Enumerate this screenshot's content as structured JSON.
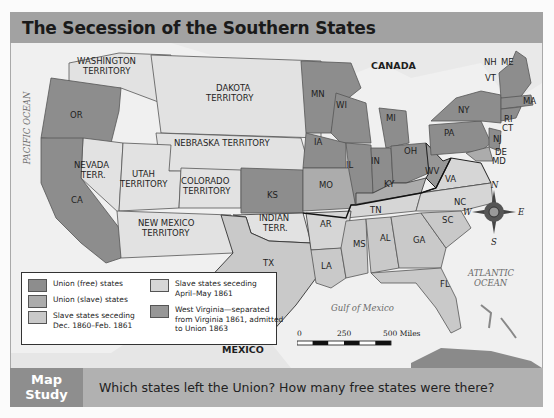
{
  "title": "The Secession of the Southern States",
  "map": {
    "colors": {
      "union_free": "#8d8d8d",
      "union_slave": "#acacac",
      "seceding_early": "#c9c9c9",
      "seceding_late": "#d6d6d6",
      "west_virginia": "#979797",
      "territory": "#e2e2e2",
      "water": "#f0f0f0",
      "foreign": "#e9e9e9"
    },
    "regions": {
      "canada": "CANADA",
      "mexico": "MEXICO",
      "pacific": "PACIFIC OCEAN",
      "atlantic_1": "ATLANTIC",
      "atlantic_2": "OCEAN",
      "gulf": "Gulf of Mexico"
    },
    "territories": {
      "washington_1": "WASHINGTON",
      "washington_2": "TERRITORY",
      "dakota_1": "DAKOTA",
      "dakota_2": "TERRITORY",
      "nebraska": "NEBRASKA TERRITORY",
      "nevada_1": "NEVADA",
      "nevada_2": "TERR.",
      "utah_1": "UTAH",
      "utah_2": "TERRITORY",
      "colorado_1": "COLORADO",
      "colorado_2": "TERRITORY",
      "newmexico_1": "NEW MEXICO",
      "newmexico_2": "TERRITORY",
      "indian_1": "INDIAN",
      "indian_2": "TERR."
    },
    "states": {
      "OR": "OR",
      "CA": "CA",
      "MN": "MN",
      "WI": "WI",
      "MI": "MI",
      "IA": "IA",
      "IL": "IL",
      "IN": "IN",
      "OH": "OH",
      "KS": "KS",
      "MO": "MO",
      "KY": "KY",
      "WV": "WV",
      "VA": "VA",
      "NC": "NC",
      "SC": "SC",
      "GA": "GA",
      "FL": "FL",
      "AL": "AL",
      "MS": "MS",
      "LA": "LA",
      "TX": "TX",
      "AR": "AR",
      "TN": "TN",
      "PA": "PA",
      "NY": "NY",
      "NJ": "NJ",
      "DE": "DE",
      "MD": "MD",
      "CT": "CT",
      "RI": "RI",
      "MA": "MA",
      "VT": "VT",
      "NH": "NH",
      "ME": "ME"
    },
    "compass": {
      "n": "N",
      "s": "S",
      "e": "E",
      "w": "W"
    },
    "scale": {
      "t0": "0",
      "t1": "250",
      "t2": "500 Miles"
    }
  },
  "legend": {
    "items": [
      {
        "label": "Union (free) states",
        "color": "#8d8d8d"
      },
      {
        "label": "Union (slave) states",
        "color": "#acacac"
      },
      {
        "label_1": "Slave states seceding",
        "label_2": "Dec. 1860–Feb. 1861",
        "color": "#c9c9c9"
      },
      {
        "label_1": "Slave states seceding",
        "label_2": "April–May 1861",
        "color": "#d6d6d6"
      },
      {
        "label_1": "West Virginia—separated",
        "label_2": "from Virginia 1861, admitted",
        "label_3": "to Union 1863",
        "color": "#979797"
      }
    ]
  },
  "footer": {
    "badge_1": "Map",
    "badge_2": "Study",
    "question": "Which states left the Union? How many free states were there?"
  }
}
